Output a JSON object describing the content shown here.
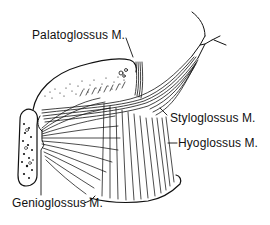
{
  "figure": {
    "colors": {
      "ink": "#111111",
      "background": "#ffffff"
    },
    "labels": [
      {
        "id": "palatoglossus",
        "text": "Palatoglossus M."
      },
      {
        "id": "styloglossus",
        "text": "Styloglossus M."
      },
      {
        "id": "hyoglossus",
        "text": "Hyoglossus M."
      },
      {
        "id": "genioglossus",
        "text": "Genioglossus M."
      }
    ]
  }
}
